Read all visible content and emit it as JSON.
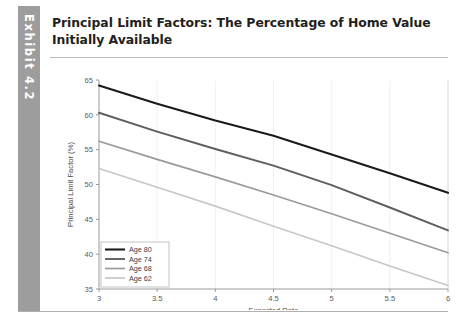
{
  "exhibit": {
    "tab_label": "Exhibit 4.2",
    "tab_color": "#9d9d9d",
    "title": "Principal Limit Factors: The Percentage of Home Value Initially Available"
  },
  "chart_data": {
    "type": "line",
    "title": "",
    "xlabel": "Expected Rate",
    "ylabel": "Principal Limit Factor (%)",
    "xlim": [
      3,
      6
    ],
    "ylim": [
      35,
      65
    ],
    "xticks": [
      3,
      3.5,
      4,
      4.5,
      5,
      5.5,
      6
    ],
    "xtick_labels": [
      "3",
      "3.5",
      "4",
      "4.5",
      "5",
      "5.5",
      "6"
    ],
    "yticks": [
      35,
      40,
      45,
      50,
      55,
      60,
      65
    ],
    "ytick_labels": [
      "35",
      "40",
      "45",
      "50",
      "55",
      "60",
      "65"
    ],
    "grid": "vertical-faint",
    "legend_position": "lower-left",
    "x": [
      3,
      3.5,
      4,
      4.5,
      5,
      5.5,
      6
    ],
    "series": [
      {
        "name": "Age 80",
        "color": "#1a1a1a",
        "width": 2.1,
        "values": [
          64.2,
          61.6,
          59.2,
          57.0,
          54.3,
          51.6,
          48.8
        ]
      },
      {
        "name": "Age 74",
        "color": "#5e5e5e",
        "width": 1.9,
        "values": [
          60.3,
          57.6,
          55.1,
          52.7,
          49.9,
          46.7,
          43.4
        ]
      },
      {
        "name": "Age 68",
        "color": "#9a9a9a",
        "width": 1.7,
        "values": [
          56.2,
          53.6,
          51.1,
          48.5,
          45.8,
          43.0,
          40.2
        ]
      },
      {
        "name": "Age 62",
        "color": "#c8c8c8",
        "width": 1.7,
        "values": [
          52.3,
          49.6,
          46.9,
          44.0,
          41.2,
          38.3,
          35.5
        ]
      }
    ]
  }
}
